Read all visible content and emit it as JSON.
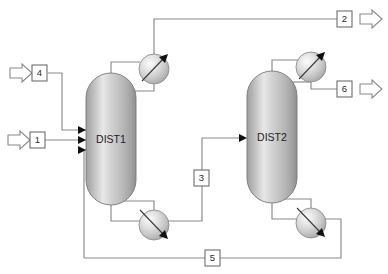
{
  "diagram": {
    "background_color": "#ffffff",
    "line_color": "#8a8a8a",
    "vessel_fill_light": "#f2f2f2",
    "vessel_fill_mid": "#c9c9c9",
    "vessel_fill_dark": "#9a9a9a",
    "arrow_color": "#111111"
  },
  "units": [
    {
      "id": "dist1",
      "label": "DIST1",
      "type": "distillation-column"
    },
    {
      "id": "dist2",
      "label": "DIST2",
      "type": "distillation-column"
    }
  ],
  "exchangers": [
    {
      "id": "cond1",
      "type": "condenser",
      "arrow_direction": "up-right"
    },
    {
      "id": "reb1",
      "type": "reboiler",
      "arrow_direction": "down-right"
    },
    {
      "id": "cond2",
      "type": "condenser",
      "arrow_direction": "up-right"
    },
    {
      "id": "reb2",
      "type": "reboiler",
      "arrow_direction": "down-right"
    }
  ],
  "streams": [
    {
      "id": "s1",
      "label": "1",
      "kind": "feed",
      "terminal": "inlet"
    },
    {
      "id": "s2",
      "label": "2",
      "kind": "product",
      "terminal": "outlet"
    },
    {
      "id": "s3",
      "label": "3",
      "kind": "internal",
      "terminal": "none"
    },
    {
      "id": "s4",
      "label": "4",
      "kind": "feed",
      "terminal": "inlet"
    },
    {
      "id": "s5",
      "label": "5",
      "kind": "recycle",
      "terminal": "none"
    },
    {
      "id": "s6",
      "label": "6",
      "kind": "product",
      "terminal": "outlet"
    }
  ]
}
